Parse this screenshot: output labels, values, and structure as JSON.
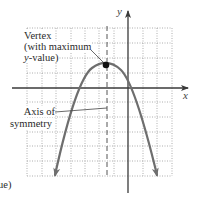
{
  "diagram": {
    "type": "parabola-annotation",
    "colors": {
      "grid": "#9a9a9a",
      "axes": "#3a3a3a",
      "curve": "#6e6e6e",
      "symmetry_axis": "#555555",
      "vertex_dot": "#111111",
      "text": "#2a2a2a"
    },
    "axes": {
      "x_label": "x",
      "y_label": "y"
    },
    "grid": {
      "columns": 10,
      "rows": 10
    },
    "curve": {
      "description": "Downward-opening parabola",
      "vertex_grid": [
        -1.5,
        1.5
      ]
    },
    "annotations": {
      "vertex": {
        "line1": "Vertex",
        "line2": "(with maximum",
        "line3_var": "y",
        "line3_rest": "-value)"
      },
      "axis_of_symmetry": {
        "line1": "Axis of",
        "line2": "symmetry"
      },
      "clipped_text": "ue)"
    }
  }
}
